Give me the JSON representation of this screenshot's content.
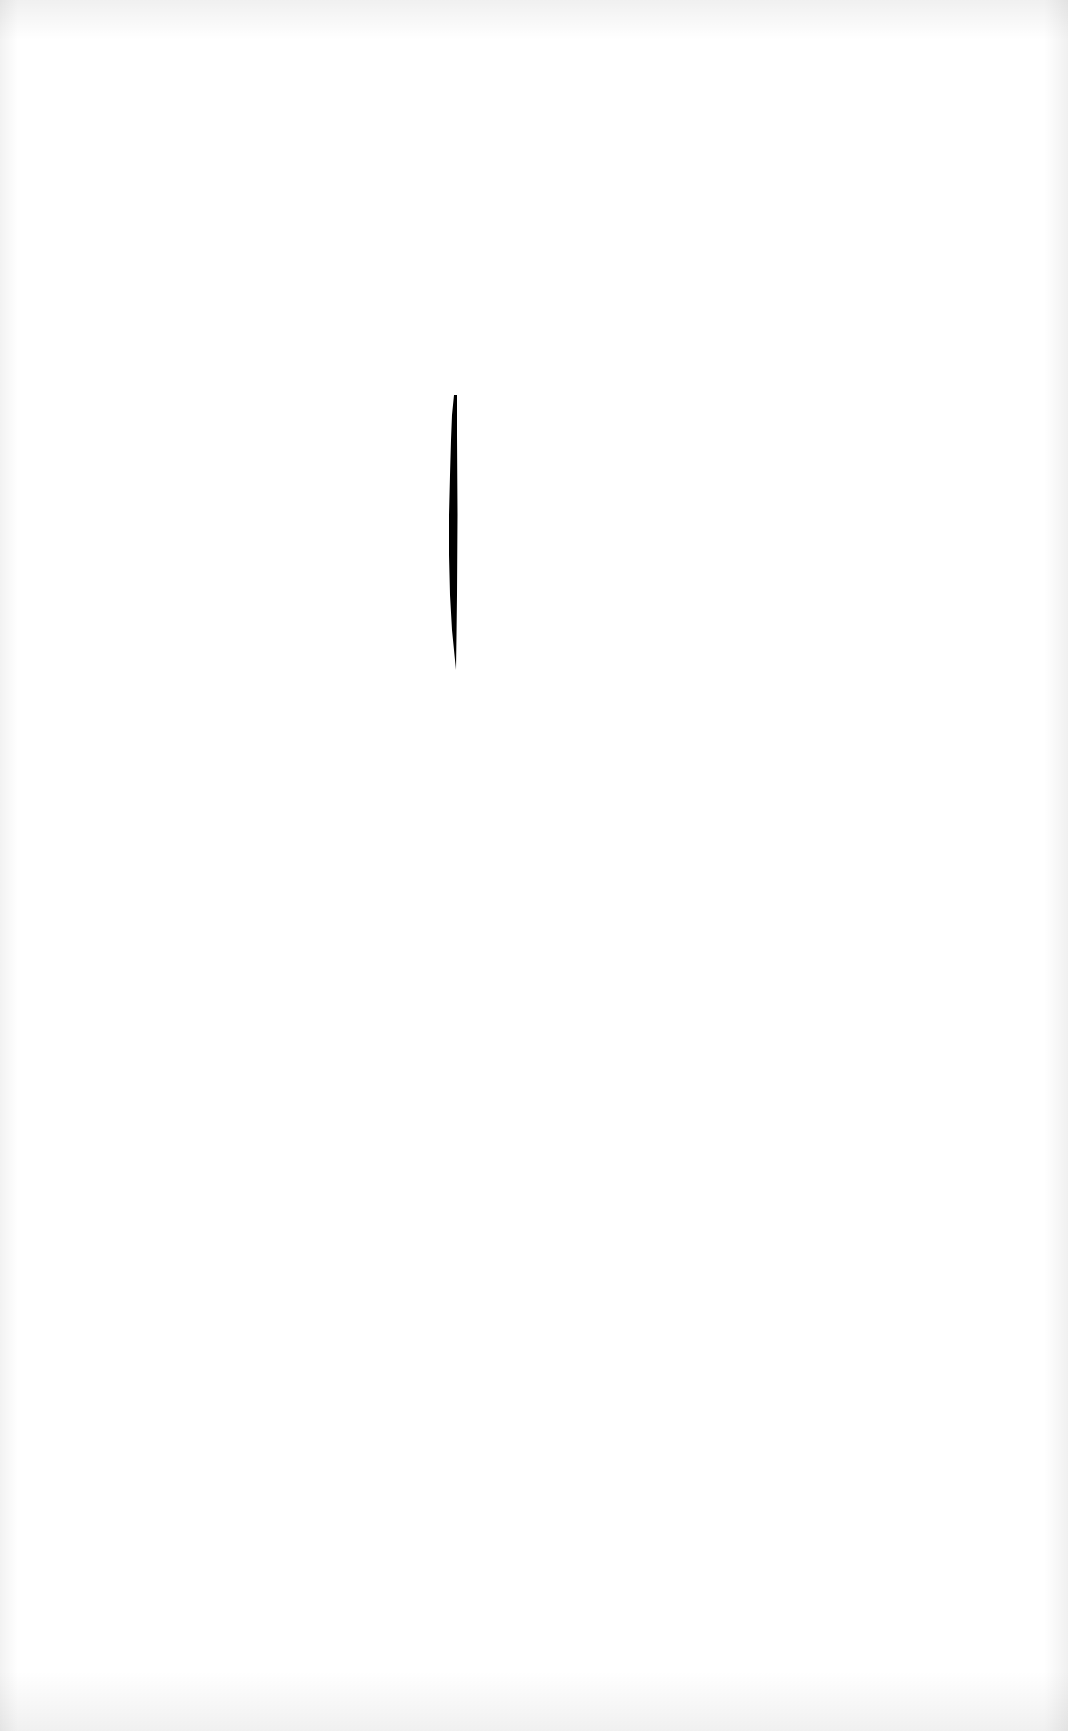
{
  "canvas": {
    "width": 1068,
    "height": 1731,
    "background_color": "#ffffff",
    "edge_tint_color": "#eeeeee"
  },
  "marks": [
    {
      "type": "crescent-brush-stroke",
      "color": "#000000",
      "orientation": "vertical",
      "approx_x": 446,
      "approx_top": 395,
      "approx_bottom": 665
    }
  ]
}
